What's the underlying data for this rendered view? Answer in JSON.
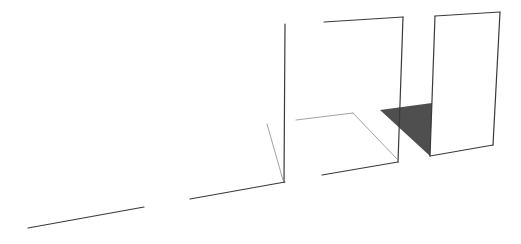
{
  "canvas": {
    "width": 521,
    "height": 244,
    "background": "#ffffff"
  },
  "colors": {
    "edge": "#3a3a3a",
    "thin_edge": "#8a8a8a",
    "shadow_fill": "#4f4f4f"
  },
  "lines": [
    {
      "id": "ground-line-left",
      "x1": 28,
      "y1": 228,
      "x2": 144,
      "y2": 207,
      "w": 1.2,
      "kind": "edge"
    },
    {
      "id": "ground-line-middle",
      "x1": 190,
      "y1": 199,
      "x2": 285,
      "y2": 182,
      "w": 1.2,
      "kind": "edge"
    },
    {
      "id": "panel1-vertical-edge",
      "x1": 285,
      "y1": 24,
      "x2": 284,
      "y2": 182,
      "w": 1.2,
      "kind": "edge"
    },
    {
      "id": "panel1-diagonal-edge",
      "x1": 267,
      "y1": 124,
      "x2": 283,
      "y2": 180,
      "w": 0.8,
      "kind": "thin_edge"
    },
    {
      "id": "panel2-top-edge",
      "x1": 324,
      "y1": 22,
      "x2": 403,
      "y2": 17,
      "w": 1.2,
      "kind": "edge"
    },
    {
      "id": "panel2-right-edge",
      "x1": 403,
      "y1": 17,
      "x2": 398,
      "y2": 162,
      "w": 1.2,
      "kind": "edge"
    },
    {
      "id": "panel2-bottom-edge",
      "x1": 322,
      "y1": 175,
      "x2": 398,
      "y2": 162,
      "w": 1.2,
      "kind": "edge"
    },
    {
      "id": "floor-back-edge",
      "x1": 296,
      "y1": 120,
      "x2": 353,
      "y2": 113,
      "w": 0.8,
      "kind": "thin_edge"
    },
    {
      "id": "floor-side-edge",
      "x1": 353,
      "y1": 113,
      "x2": 398,
      "y2": 160,
      "w": 0.8,
      "kind": "thin_edge"
    },
    {
      "id": "panel3-top-edge",
      "x1": 435,
      "y1": 16,
      "x2": 500,
      "y2": 12,
      "w": 1.2,
      "kind": "edge"
    },
    {
      "id": "panel3-right-edge",
      "x1": 500,
      "y1": 12,
      "x2": 493,
      "y2": 145,
      "w": 1.2,
      "kind": "edge"
    },
    {
      "id": "panel3-bottom-edge",
      "x1": 430,
      "y1": 156,
      "x2": 493,
      "y2": 145,
      "w": 1.2,
      "kind": "edge"
    },
    {
      "id": "panel3-left-edge",
      "x1": 435,
      "y1": 16,
      "x2": 430,
      "y2": 156,
      "w": 1.2,
      "kind": "edge"
    }
  ],
  "polygons": [
    {
      "id": "shadow-triangle",
      "points": "380,110 432,103 430,156",
      "kind": "shadow_fill"
    }
  ]
}
